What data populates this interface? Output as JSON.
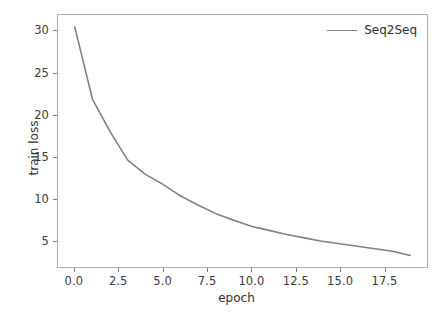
{
  "chart_data": {
    "type": "line",
    "title": "",
    "xlabel": "epoch",
    "ylabel": "train loss",
    "xlim": [
      -0.95,
      19.95
    ],
    "ylim": [
      1.82,
      31.95
    ],
    "grid": false,
    "legend_position": "upper right",
    "xticks": [
      "0.0",
      "2.5",
      "5.0",
      "7.5",
      "10.0",
      "12.5",
      "15.0",
      "17.5"
    ],
    "xtick_values": [
      0.0,
      2.5,
      5.0,
      7.5,
      10.0,
      12.5,
      15.0,
      17.5
    ],
    "yticks": [
      "5",
      "10",
      "15",
      "20",
      "25",
      "30"
    ],
    "ytick_values": [
      5,
      10,
      15,
      20,
      25,
      30
    ],
    "line_color": "#808080",
    "line_width": 1.6,
    "series": [
      {
        "name": "Seq2Seq",
        "x": [
          0,
          1,
          2,
          3,
          4,
          5,
          6,
          7,
          8,
          9,
          10,
          11,
          12,
          13,
          14,
          15,
          16,
          17,
          18,
          19
        ],
        "values": [
          30.5,
          21.9,
          18.0,
          14.6,
          12.9,
          11.7,
          10.3,
          9.2,
          8.2,
          7.4,
          6.7,
          6.2,
          5.7,
          5.3,
          4.9,
          4.6,
          4.3,
          4.0,
          3.7,
          3.2
        ]
      }
    ]
  },
  "legend": {
    "entries": [
      {
        "label": "Seq2Seq",
        "color": "#808080"
      }
    ]
  },
  "axes": {
    "spine_color": "#b0b0b0",
    "tick_color": "#7a7a7a",
    "text_color": "#303030"
  }
}
